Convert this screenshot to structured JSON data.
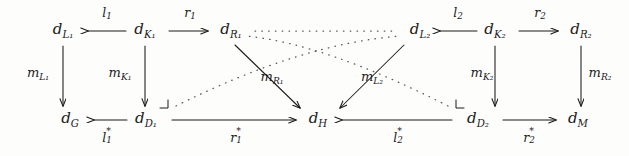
{
  "diagram": {
    "kind": "commutative-diagram",
    "width": 629,
    "height": 156,
    "background_color": "#fdfdfc",
    "ink_color": "#1b1b1b",
    "nodes": [
      {
        "id": "dL1",
        "base": "d",
        "sub": "L₁",
        "label": "d_L1",
        "x": 63,
        "y": 31
      },
      {
        "id": "dK1",
        "base": "d",
        "sub": "K₁",
        "label": "d_K1",
        "x": 145,
        "y": 31
      },
      {
        "id": "dR1",
        "base": "d",
        "sub": "R₁",
        "label": "d_R1",
        "x": 231,
        "y": 31
      },
      {
        "id": "dL2",
        "base": "d",
        "sub": "L₂",
        "label": "d_L2",
        "x": 420,
        "y": 31
      },
      {
        "id": "dK2",
        "base": "d",
        "sub": "K₂",
        "label": "d_K2",
        "x": 495,
        "y": 31
      },
      {
        "id": "dR2",
        "base": "d",
        "sub": "R₂",
        "label": "d_R2",
        "x": 581,
        "y": 31
      },
      {
        "id": "dG",
        "base": "d",
        "sub": "G",
        "label": "d_G",
        "x": 70,
        "y": 120
      },
      {
        "id": "dD1",
        "base": "d",
        "sub": "D₁",
        "label": "d_D1",
        "x": 146,
        "y": 120
      },
      {
        "id": "dH",
        "base": "d",
        "sub": "H",
        "label": "d_H",
        "x": 318,
        "y": 120
      },
      {
        "id": "dD2",
        "base": "d",
        "sub": "D₂",
        "label": "d_D2",
        "x": 478,
        "y": 120
      },
      {
        "id": "dM",
        "base": "d",
        "sub": "M",
        "label": "d_M",
        "x": 578,
        "y": 120
      }
    ],
    "edge_labels": [
      {
        "id": "l1",
        "base": "l",
        "sub": "1",
        "star": false,
        "label": "l_1",
        "x": 107,
        "y": 14,
        "size": "small"
      },
      {
        "id": "r1",
        "base": "r",
        "sub": "1",
        "star": false,
        "label": "r_1",
        "x": 190,
        "y": 14,
        "size": "small"
      },
      {
        "id": "l2",
        "base": "l",
        "sub": "2",
        "star": false,
        "label": "l_2",
        "x": 458,
        "y": 14,
        "size": "small"
      },
      {
        "id": "r2",
        "base": "r",
        "sub": "2",
        "star": false,
        "label": "r_2",
        "x": 540,
        "y": 14,
        "size": "small"
      },
      {
        "id": "mL1",
        "base": "m",
        "sub": "L₁",
        "star": false,
        "label": "m_L1",
        "x": 38,
        "y": 74,
        "size": "mid"
      },
      {
        "id": "mK1",
        "base": "m",
        "sub": "K₁",
        "star": false,
        "label": "m_K1",
        "x": 120,
        "y": 74,
        "size": "mid"
      },
      {
        "id": "mR1",
        "base": "m",
        "sub": "R₁",
        "star": false,
        "label": "m_R1",
        "x": 272,
        "y": 78,
        "size": "mid"
      },
      {
        "id": "mL2",
        "base": "m",
        "sub": "L₂",
        "star": false,
        "label": "m_L2",
        "x": 372,
        "y": 78,
        "size": "mid"
      },
      {
        "id": "mK2",
        "base": "m",
        "sub": "K₂",
        "star": false,
        "label": "m_K2",
        "x": 482,
        "y": 74,
        "size": "mid"
      },
      {
        "id": "mR2",
        "base": "m",
        "sub": "R₂",
        "star": false,
        "label": "m_R2",
        "x": 600,
        "y": 74,
        "size": "mid"
      },
      {
        "id": "l1s",
        "base": "l",
        "sub": "1",
        "star": true,
        "label": "l_1^*",
        "x": 107,
        "y": 138,
        "size": "small"
      },
      {
        "id": "r1s",
        "base": "r",
        "sub": "1",
        "star": true,
        "label": "r_1^*",
        "x": 236,
        "y": 138,
        "size": "small"
      },
      {
        "id": "l2s",
        "base": "l",
        "sub": "2",
        "star": true,
        "label": "l_2^*",
        "x": 398,
        "y": 138,
        "size": "small"
      },
      {
        "id": "r2s",
        "base": "r",
        "sub": "2",
        "star": true,
        "label": "r_2^*",
        "x": 529,
        "y": 138,
        "size": "small"
      }
    ],
    "edges": [
      {
        "id": "e-l1",
        "from": "dK1",
        "to": "dL1",
        "style": "solid",
        "direction": "left",
        "label": "l_1"
      },
      {
        "id": "e-r1",
        "from": "dK1",
        "to": "dR1",
        "style": "solid",
        "direction": "right",
        "label": "r_1"
      },
      {
        "id": "e-l2",
        "from": "dK2",
        "to": "dL2",
        "style": "solid",
        "direction": "left",
        "label": "l_2"
      },
      {
        "id": "e-r2",
        "from": "dK2",
        "to": "dR2",
        "style": "solid",
        "direction": "right",
        "label": "r_2"
      },
      {
        "id": "e-mL1",
        "from": "dL1",
        "to": "dG",
        "style": "solid",
        "direction": "down",
        "label": "m_L1"
      },
      {
        "id": "e-mK1",
        "from": "dK1",
        "to": "dD1",
        "style": "solid",
        "direction": "down",
        "label": "m_K1"
      },
      {
        "id": "e-mR1",
        "from": "dR1",
        "to": "dH",
        "style": "solid",
        "direction": "diagonal-down-right",
        "label": "m_R1"
      },
      {
        "id": "e-mL2",
        "from": "dL2",
        "to": "dH",
        "style": "solid",
        "direction": "diagonal-down-left",
        "label": "m_L2"
      },
      {
        "id": "e-mK2",
        "from": "dK2",
        "to": "dD2",
        "style": "solid",
        "direction": "down",
        "label": "m_K2"
      },
      {
        "id": "e-mR2",
        "from": "dR2",
        "to": "dM",
        "style": "solid",
        "direction": "down",
        "label": "m_R2"
      },
      {
        "id": "e-l1s",
        "from": "dD1",
        "to": "dG",
        "style": "solid",
        "direction": "left",
        "label": "l_1^*"
      },
      {
        "id": "e-r1s",
        "from": "dD1",
        "to": "dH",
        "style": "solid",
        "direction": "right",
        "label": "r_1^*"
      },
      {
        "id": "e-l2s",
        "from": "dD2",
        "to": "dH",
        "style": "solid",
        "direction": "left",
        "label": "l_2^*"
      },
      {
        "id": "e-r2s",
        "from": "dD2",
        "to": "dM",
        "style": "solid",
        "direction": "right",
        "label": "r_2^*"
      },
      {
        "id": "e-dot-top",
        "from": "dR1",
        "to": "dL2",
        "style": "dotted",
        "direction": "none",
        "label": ""
      },
      {
        "id": "e-dot-left",
        "from": "dD1",
        "to": "dL2",
        "style": "dotted",
        "direction": "none",
        "label": ""
      },
      {
        "id": "e-dot-right",
        "from": "dD2",
        "to": "dR1",
        "style": "dotted",
        "direction": "none",
        "label": ""
      }
    ],
    "pushout_markers": [
      {
        "id": "po-left",
        "x": 167,
        "y": 103,
        "orientation": "up-right"
      },
      {
        "id": "po-right",
        "x": 457,
        "y": 103,
        "orientation": "up-left"
      }
    ]
  }
}
